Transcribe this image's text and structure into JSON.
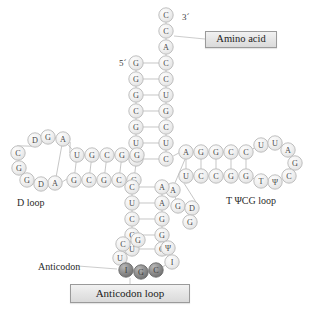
{
  "figure": {
    "type": "trna-cloverleaf-diagram"
  },
  "labels": {
    "amino_acid": "Amino acid",
    "d_loop": "D loop",
    "tpsicg_loop": "T ΨCG loop",
    "anticodon": "Anticodon",
    "anticodon_loop": "Anticodon loop",
    "five_prime": "5´",
    "three_prime": "3´"
  },
  "colors": {
    "base_fill_light": "#f0f0f0",
    "base_fill_highlight": "#fbfbfb",
    "base_stroke": "#b9b9b9",
    "base_fill_dark": "#8e8e8e",
    "base_stroke_dark": "#6a6a6a",
    "bond_stroke": "#bcbcbc",
    "text": "#2b2b2b",
    "box_border": "#9a9a9a",
    "page_background": "#ffffff"
  },
  "acceptor_stem": {
    "name": "acceptor-stem",
    "three_prime_tail": [
      {
        "letter": "C",
        "x": 166,
        "y": 15
      },
      {
        "letter": "C",
        "x": 166,
        "y": 31
      },
      {
        "letter": "A",
        "x": 166,
        "y": 47
      }
    ],
    "right_strand": [
      {
        "letter": "C",
        "x": 166,
        "y": 63
      },
      {
        "letter": "C",
        "x": 166,
        "y": 79
      },
      {
        "letter": "U",
        "x": 166,
        "y": 95
      },
      {
        "letter": "G",
        "x": 166,
        "y": 111
      },
      {
        "letter": "C",
        "x": 166,
        "y": 127
      },
      {
        "letter": "U",
        "x": 166,
        "y": 143
      },
      {
        "letter": "C",
        "x": 166,
        "y": 159
      }
    ],
    "left_strand": [
      {
        "letter": "G",
        "x": 136,
        "y": 63
      },
      {
        "letter": "G",
        "x": 136,
        "y": 79
      },
      {
        "letter": "G",
        "x": 136,
        "y": 95
      },
      {
        "letter": "C",
        "x": 136,
        "y": 111
      },
      {
        "letter": "G",
        "x": 136,
        "y": 127
      },
      {
        "letter": "U",
        "x": 136,
        "y": 143
      },
      {
        "letter": "G",
        "x": 136,
        "y": 159
      }
    ]
  },
  "d_arm": {
    "name": "d-arm",
    "top_strand": [
      {
        "letter": "U",
        "x": 77,
        "y": 155
      },
      {
        "letter": "G",
        "x": 92,
        "y": 155
      },
      {
        "letter": "C",
        "x": 107,
        "y": 155
      },
      {
        "letter": "G",
        "x": 122,
        "y": 155
      },
      {
        "letter": "G",
        "x": 137,
        "y": 155
      }
    ],
    "bottom_strand": [
      {
        "letter": "G",
        "x": 74,
        "y": 180
      },
      {
        "letter": "C",
        "x": 89,
        "y": 180
      },
      {
        "letter": "G",
        "x": 104,
        "y": 180
      },
      {
        "letter": "C",
        "x": 119,
        "y": 180
      },
      {
        "letter": "G",
        "x": 134,
        "y": 180
      }
    ],
    "loop": [
      {
        "letter": "D",
        "x": 35,
        "y": 140
      },
      {
        "letter": "G",
        "x": 48,
        "y": 137
      },
      {
        "letter": "A",
        "x": 63,
        "y": 139
      },
      {
        "letter": "A",
        "x": 55,
        "y": 183
      },
      {
        "letter": "D",
        "x": 41,
        "y": 184
      },
      {
        "letter": "G",
        "x": 27,
        "y": 180
      },
      {
        "letter": "G",
        "x": 19,
        "y": 168
      },
      {
        "letter": "C",
        "x": 18,
        "y": 153
      }
    ]
  },
  "anticodon_arm": {
    "name": "anticodon-arm",
    "left_strand": [
      {
        "letter": "C",
        "x": 132,
        "y": 187
      },
      {
        "letter": "U",
        "x": 132,
        "y": 203
      },
      {
        "letter": "C",
        "x": 132,
        "y": 219
      },
      {
        "letter": "C",
        "x": 132,
        "y": 235
      },
      {
        "letter": "U",
        "x": 132,
        "y": 249
      }
    ],
    "right_strand": [
      {
        "letter": "A",
        "x": 162,
        "y": 187
      },
      {
        "letter": "A",
        "x": 162,
        "y": 203
      },
      {
        "letter": "G",
        "x": 162,
        "y": 219
      },
      {
        "letter": "G",
        "x": 162,
        "y": 235
      },
      {
        "letter": "G",
        "x": 162,
        "y": 249
      }
    ],
    "loop": [
      {
        "letter": "U",
        "x": 120,
        "y": 258
      },
      {
        "letter": "C",
        "x": 123,
        "y": 244
      },
      {
        "letter": "G",
        "x": 138,
        "y": 240
      },
      {
        "letter": "Ψ",
        "x": 168,
        "y": 248
      },
      {
        "letter": "I",
        "x": 172,
        "y": 262
      }
    ],
    "anticodon_bases": [
      {
        "letter": "I",
        "x": 126,
        "y": 270
      },
      {
        "letter": "G",
        "x": 141,
        "y": 272
      },
      {
        "letter": "C",
        "x": 156,
        "y": 270
      }
    ]
  },
  "variable_loop": {
    "name": "variable-loop",
    "bases": [
      {
        "letter": "A",
        "x": 173,
        "y": 190
      },
      {
        "letter": "G",
        "x": 178,
        "y": 206
      },
      {
        "letter": "D",
        "x": 192,
        "y": 208
      },
      {
        "letter": "G",
        "x": 190,
        "y": 222
      }
    ]
  },
  "t_arm": {
    "name": "t-arm",
    "top_strand": [
      {
        "letter": "A",
        "x": 186,
        "y": 152
      },
      {
        "letter": "G",
        "x": 201,
        "y": 152
      },
      {
        "letter": "G",
        "x": 216,
        "y": 152
      },
      {
        "letter": "C",
        "x": 231,
        "y": 152
      },
      {
        "letter": "C",
        "x": 246,
        "y": 152
      }
    ],
    "bottom_strand": [
      {
        "letter": "U",
        "x": 186,
        "y": 176
      },
      {
        "letter": "C",
        "x": 201,
        "y": 176
      },
      {
        "letter": "C",
        "x": 216,
        "y": 176
      },
      {
        "letter": "G",
        "x": 231,
        "y": 176
      },
      {
        "letter": "G",
        "x": 246,
        "y": 176
      }
    ],
    "loop": [
      {
        "letter": "U",
        "x": 261,
        "y": 145
      },
      {
        "letter": "U",
        "x": 275,
        "y": 143
      },
      {
        "letter": "A",
        "x": 288,
        "y": 150
      },
      {
        "letter": "G",
        "x": 295,
        "y": 163
      },
      {
        "letter": "C",
        "x": 289,
        "y": 176
      },
      {
        "letter": "Ψ",
        "x": 275,
        "y": 182
      },
      {
        "letter": "T",
        "x": 261,
        "y": 181
      }
    ]
  }
}
